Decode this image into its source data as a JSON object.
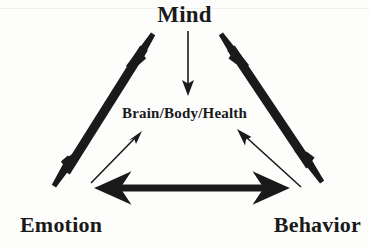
{
  "diagram": {
    "title_node": "Mind",
    "center_node": "Brain/Body/Health",
    "left_node": "Emotion",
    "right_node": "Behavior",
    "ink_color": "#1a1a1a",
    "background_color": "#fdfdfc",
    "nodes": [
      {
        "id": "mind",
        "label": "Mind",
        "x": 186,
        "y": 14
      },
      {
        "id": "center",
        "label": "Brain/Body/Health",
        "x": 185,
        "y": 114
      },
      {
        "id": "emotion",
        "label": "Emotion",
        "x": 63,
        "y": 224
      },
      {
        "id": "behavior",
        "label": "Behavior",
        "x": 317,
        "y": 224
      }
    ],
    "edges": [
      {
        "id": "mind-emotion",
        "from": "mind",
        "to": "emotion",
        "style": "thick",
        "heads": "both"
      },
      {
        "id": "mind-behavior",
        "from": "mind",
        "to": "behavior",
        "style": "thick",
        "heads": "both"
      },
      {
        "id": "emotion-behavior",
        "from": "emotion",
        "to": "behavior",
        "style": "thick",
        "heads": "both"
      },
      {
        "id": "mind-center",
        "from": "mind",
        "to": "center",
        "style": "thin",
        "heads": "end"
      },
      {
        "id": "emotion-center",
        "from": "emotion",
        "to": "center",
        "style": "thin",
        "heads": "end"
      },
      {
        "id": "behavior-center",
        "from": "behavior",
        "to": "center",
        "style": "thin",
        "heads": "end"
      }
    ]
  }
}
